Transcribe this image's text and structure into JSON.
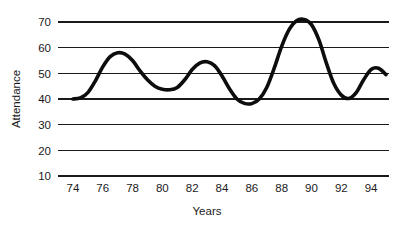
{
  "chart_data": {
    "type": "line",
    "title": "",
    "xlabel": "Years",
    "ylabel": "Attendance",
    "grid": "horizontal",
    "legend": "none",
    "xlim": [
      73,
      95.2
    ],
    "ylim": [
      10,
      70
    ],
    "yticks": [
      70,
      60,
      50,
      40,
      30,
      20,
      10
    ],
    "ytick_labels": [
      "70",
      "60",
      "50",
      "40",
      "30",
      "20",
      "10"
    ],
    "xticks": [
      74,
      76,
      78,
      80,
      82,
      84,
      86,
      88,
      90,
      92,
      94
    ],
    "xtick_labels": [
      "74",
      "76",
      "78",
      "80",
      "82",
      "84",
      "86",
      "88",
      "90",
      "92",
      "94"
    ],
    "series": [
      {
        "name": "Attendance",
        "color": "#0d0d0d",
        "x": [
          74.0,
          74.5,
          75.0,
          75.5,
          76.0,
          76.5,
          77.0,
          77.5,
          78.0,
          78.5,
          79.0,
          79.5,
          80.0,
          80.5,
          81.0,
          81.5,
          82.0,
          82.5,
          83.0,
          83.5,
          84.0,
          84.5,
          85.0,
          85.5,
          86.0,
          86.5,
          87.0,
          87.5,
          88.0,
          88.5,
          89.0,
          89.5,
          90.0,
          90.5,
          91.0,
          91.5,
          92.0,
          92.5,
          93.0,
          93.5,
          94.0,
          94.5,
          95.0
        ],
        "values": [
          40.0,
          40.4,
          42.5,
          47.0,
          52.5,
          56.5,
          58.0,
          57.5,
          55.0,
          51.0,
          47.5,
          45.0,
          43.8,
          43.6,
          44.5,
          47.5,
          51.5,
          54.0,
          54.5,
          53.0,
          49.0,
          44.0,
          40.0,
          38.3,
          38.2,
          40.0,
          44.5,
          52.0,
          60.5,
          67.0,
          70.5,
          71.0,
          69.0,
          63.0,
          54.0,
          46.0,
          41.5,
          40.2,
          42.5,
          47.5,
          51.5,
          52.0,
          49.5
        ]
      }
    ],
    "annotations": []
  },
  "axis": {
    "y_title": "Attendance",
    "x_title": "Years"
  }
}
